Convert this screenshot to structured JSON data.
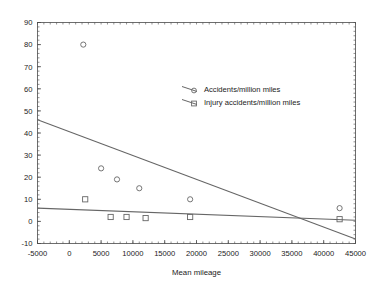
{
  "chart_data": {
    "type": "scatter",
    "title": "",
    "xlabel": "Mean mileage",
    "ylabel": "",
    "xlim": [
      -5000,
      45000
    ],
    "ylim": [
      -10,
      90
    ],
    "xticks": [
      -5000,
      0,
      5000,
      10000,
      15000,
      20000,
      25000,
      30000,
      35000,
      40000,
      45000
    ],
    "xtick_labels": [
      "-5000",
      "0",
      "5000",
      "10000",
      "15000",
      "20000",
      "25000",
      "30000",
      "35000",
      "40000",
      "45000"
    ],
    "yticks": [
      -10,
      0,
      10,
      20,
      30,
      40,
      50,
      60,
      70,
      80,
      90
    ],
    "ytick_labels": [
      "-10",
      "0",
      "10",
      "20",
      "30",
      "40",
      "50",
      "60",
      "70",
      "80",
      "90"
    ],
    "grid": false,
    "legend_position": "upper-center-right",
    "series": [
      {
        "name": "Accidents/million miles",
        "marker": "circle",
        "color": "#666666",
        "points": [
          {
            "x": 2200,
            "y": 80
          },
          {
            "x": 5000,
            "y": 24
          },
          {
            "x": 7500,
            "y": 19
          },
          {
            "x": 11000,
            "y": 15
          },
          {
            "x": 19000,
            "y": 10
          },
          {
            "x": 42500,
            "y": 6
          }
        ],
        "trendline": {
          "x0": -5000,
          "y0": 46,
          "x1": 45000,
          "y1": -8
        }
      },
      {
        "name": "Injury accidents/million miles",
        "marker": "square",
        "color": "#666666",
        "points": [
          {
            "x": 2500,
            "y": 10
          },
          {
            "x": 6500,
            "y": 2
          },
          {
            "x": 9000,
            "y": 2
          },
          {
            "x": 12000,
            "y": 1.5
          },
          {
            "x": 19000,
            "y": 2
          },
          {
            "x": 42500,
            "y": 1
          }
        ],
        "trendline": {
          "x0": -5000,
          "y0": 6,
          "x1": 45000,
          "y1": 0.5
        }
      }
    ],
    "legend": [
      {
        "label": "Accidents/million miles",
        "marker": "circle"
      },
      {
        "label": "Injury accidents/million miles",
        "marker": "square"
      }
    ]
  }
}
